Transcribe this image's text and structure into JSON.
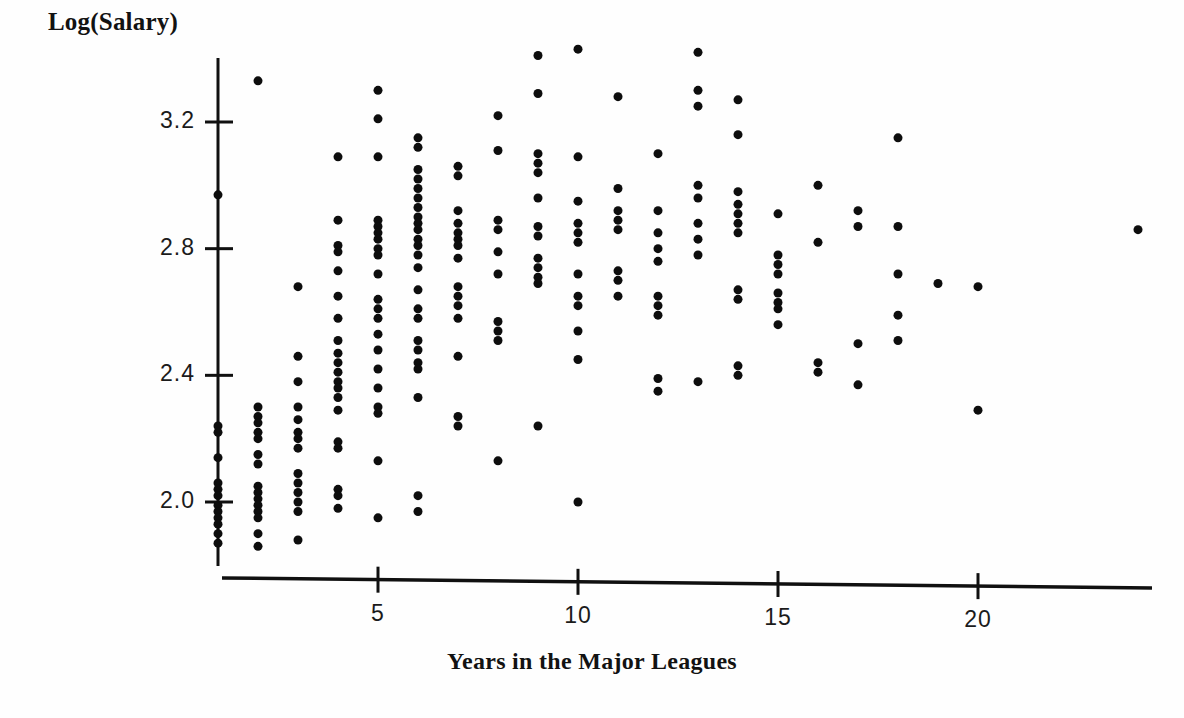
{
  "chart_data": {
    "type": "scatter",
    "title": "",
    "xlabel": "Years in the Major Leagues",
    "ylabel": "Log(Salary)",
    "xlim": [
      0,
      25
    ],
    "ylim": [
      1.8,
      3.45
    ],
    "grid": false,
    "legend": "none",
    "xticks": [
      5,
      10,
      15,
      20
    ],
    "yticks": [
      "2.0",
      "2.4",
      "2.8",
      "3.2"
    ],
    "ytick_values": [
      2.0,
      2.4,
      2.8,
      3.2
    ],
    "marker": "filled-circle",
    "marker_color": "#0d0d0d",
    "marker_size_px": 9,
    "points": [
      [
        1,
        2.97
      ],
      [
        1,
        2.24
      ],
      [
        1,
        2.22
      ],
      [
        1,
        2.14
      ],
      [
        1,
        2.06
      ],
      [
        1,
        2.04
      ],
      [
        1,
        2.02
      ],
      [
        1,
        1.99
      ],
      [
        1,
        1.97
      ],
      [
        1,
        1.95
      ],
      [
        1,
        1.93
      ],
      [
        1,
        1.9
      ],
      [
        1,
        1.87
      ],
      [
        2,
        3.33
      ],
      [
        2,
        2.3
      ],
      [
        2,
        2.27
      ],
      [
        2,
        2.25
      ],
      [
        2,
        2.22
      ],
      [
        2,
        2.2
      ],
      [
        2,
        2.15
      ],
      [
        2,
        2.12
      ],
      [
        2,
        2.05
      ],
      [
        2,
        2.03
      ],
      [
        2,
        2.01
      ],
      [
        2,
        1.99
      ],
      [
        2,
        1.97
      ],
      [
        2,
        1.95
      ],
      [
        2,
        1.9
      ],
      [
        2,
        1.86
      ],
      [
        3,
        2.68
      ],
      [
        3,
        2.46
      ],
      [
        3,
        2.38
      ],
      [
        3,
        2.3
      ],
      [
        3,
        2.26
      ],
      [
        3,
        2.22
      ],
      [
        3,
        2.2
      ],
      [
        3,
        2.17
      ],
      [
        3,
        2.09
      ],
      [
        3,
        2.06
      ],
      [
        3,
        2.03
      ],
      [
        3,
        2.0
      ],
      [
        3,
        1.97
      ],
      [
        3,
        1.88
      ],
      [
        4,
        3.09
      ],
      [
        4,
        2.89
      ],
      [
        4,
        2.81
      ],
      [
        4,
        2.79
      ],
      [
        4,
        2.73
      ],
      [
        4,
        2.65
      ],
      [
        4,
        2.58
      ],
      [
        4,
        2.51
      ],
      [
        4,
        2.47
      ],
      [
        4,
        2.44
      ],
      [
        4,
        2.41
      ],
      [
        4,
        2.38
      ],
      [
        4,
        2.36
      ],
      [
        4,
        2.33
      ],
      [
        4,
        2.29
      ],
      [
        4,
        2.19
      ],
      [
        4,
        2.17
      ],
      [
        4,
        2.04
      ],
      [
        4,
        2.02
      ],
      [
        4,
        1.98
      ],
      [
        5,
        3.3
      ],
      [
        5,
        3.21
      ],
      [
        5,
        3.09
      ],
      [
        5,
        2.89
      ],
      [
        5,
        2.87
      ],
      [
        5,
        2.85
      ],
      [
        5,
        2.83
      ],
      [
        5,
        2.8
      ],
      [
        5,
        2.78
      ],
      [
        5,
        2.72
      ],
      [
        5,
        2.64
      ],
      [
        5,
        2.61
      ],
      [
        5,
        2.58
      ],
      [
        5,
        2.53
      ],
      [
        5,
        2.48
      ],
      [
        5,
        2.42
      ],
      [
        5,
        2.36
      ],
      [
        5,
        2.3
      ],
      [
        5,
        2.28
      ],
      [
        5,
        2.13
      ],
      [
        5,
        1.95
      ],
      [
        6,
        3.15
      ],
      [
        6,
        3.12
      ],
      [
        6,
        3.05
      ],
      [
        6,
        3.02
      ],
      [
        6,
        2.99
      ],
      [
        6,
        2.96
      ],
      [
        6,
        2.93
      ],
      [
        6,
        2.9
      ],
      [
        6,
        2.88
      ],
      [
        6,
        2.86
      ],
      [
        6,
        2.83
      ],
      [
        6,
        2.81
      ],
      [
        6,
        2.78
      ],
      [
        6,
        2.74
      ],
      [
        6,
        2.67
      ],
      [
        6,
        2.61
      ],
      [
        6,
        2.58
      ],
      [
        6,
        2.51
      ],
      [
        6,
        2.48
      ],
      [
        6,
        2.44
      ],
      [
        6,
        2.42
      ],
      [
        6,
        2.33
      ],
      [
        6,
        2.02
      ],
      [
        6,
        1.97
      ],
      [
        7,
        3.06
      ],
      [
        7,
        3.03
      ],
      [
        7,
        2.92
      ],
      [
        7,
        2.88
      ],
      [
        7,
        2.85
      ],
      [
        7,
        2.83
      ],
      [
        7,
        2.81
      ],
      [
        7,
        2.77
      ],
      [
        7,
        2.68
      ],
      [
        7,
        2.65
      ],
      [
        7,
        2.62
      ],
      [
        7,
        2.58
      ],
      [
        7,
        2.46
      ],
      [
        7,
        2.27
      ],
      [
        7,
        2.24
      ],
      [
        8,
        3.22
      ],
      [
        8,
        3.11
      ],
      [
        8,
        2.89
      ],
      [
        8,
        2.86
      ],
      [
        8,
        2.79
      ],
      [
        8,
        2.72
      ],
      [
        8,
        2.57
      ],
      [
        8,
        2.54
      ],
      [
        8,
        2.51
      ],
      [
        8,
        2.13
      ],
      [
        9,
        3.41
      ],
      [
        9,
        3.29
      ],
      [
        9,
        3.1
      ],
      [
        9,
        3.07
      ],
      [
        9,
        3.04
      ],
      [
        9,
        2.96
      ],
      [
        9,
        2.87
      ],
      [
        9,
        2.84
      ],
      [
        9,
        2.77
      ],
      [
        9,
        2.74
      ],
      [
        9,
        2.71
      ],
      [
        9,
        2.69
      ],
      [
        9,
        2.24
      ],
      [
        10,
        3.43
      ],
      [
        10,
        3.09
      ],
      [
        10,
        2.95
      ],
      [
        10,
        2.88
      ],
      [
        10,
        2.85
      ],
      [
        10,
        2.82
      ],
      [
        10,
        2.72
      ],
      [
        10,
        2.65
      ],
      [
        10,
        2.62
      ],
      [
        10,
        2.54
      ],
      [
        10,
        2.45
      ],
      [
        10,
        2.0
      ],
      [
        11,
        3.28
      ],
      [
        11,
        2.99
      ],
      [
        11,
        2.92
      ],
      [
        11,
        2.89
      ],
      [
        11,
        2.86
      ],
      [
        11,
        2.73
      ],
      [
        11,
        2.7
      ],
      [
        11,
        2.65
      ],
      [
        12,
        3.1
      ],
      [
        12,
        2.92
      ],
      [
        12,
        2.85
      ],
      [
        12,
        2.8
      ],
      [
        12,
        2.76
      ],
      [
        12,
        2.65
      ],
      [
        12,
        2.62
      ],
      [
        12,
        2.59
      ],
      [
        12,
        2.39
      ],
      [
        12,
        2.35
      ],
      [
        13,
        3.42
      ],
      [
        13,
        3.3
      ],
      [
        13,
        3.25
      ],
      [
        13,
        3.0
      ],
      [
        13,
        2.96
      ],
      [
        13,
        2.88
      ],
      [
        13,
        2.83
      ],
      [
        13,
        2.78
      ],
      [
        13,
        2.38
      ],
      [
        14,
        3.27
      ],
      [
        14,
        3.16
      ],
      [
        14,
        2.98
      ],
      [
        14,
        2.94
      ],
      [
        14,
        2.91
      ],
      [
        14,
        2.88
      ],
      [
        14,
        2.85
      ],
      [
        14,
        2.67
      ],
      [
        14,
        2.64
      ],
      [
        14,
        2.43
      ],
      [
        14,
        2.4
      ],
      [
        15,
        2.91
      ],
      [
        15,
        2.78
      ],
      [
        15,
        2.75
      ],
      [
        15,
        2.72
      ],
      [
        15,
        2.66
      ],
      [
        15,
        2.63
      ],
      [
        15,
        2.61
      ],
      [
        15,
        2.56
      ],
      [
        16,
        3.0
      ],
      [
        16,
        2.82
      ],
      [
        16,
        2.44
      ],
      [
        16,
        2.41
      ],
      [
        17,
        2.92
      ],
      [
        17,
        2.87
      ],
      [
        17,
        2.5
      ],
      [
        17,
        2.37
      ],
      [
        18,
        3.15
      ],
      [
        18,
        2.87
      ],
      [
        18,
        2.72
      ],
      [
        18,
        2.59
      ],
      [
        18,
        2.51
      ],
      [
        19,
        2.69
      ],
      [
        20,
        2.68
      ],
      [
        20,
        2.29
      ],
      [
        24,
        2.86
      ]
    ]
  },
  "axes": {
    "y_axis_label": "Log(Salary)",
    "x_axis_label": "Years in the Major Leagues",
    "x_tick_labels": [
      "5",
      "10",
      "15",
      "20"
    ],
    "y_tick_labels": [
      "3.2",
      "2.8",
      "2.4",
      "2.0"
    ]
  }
}
